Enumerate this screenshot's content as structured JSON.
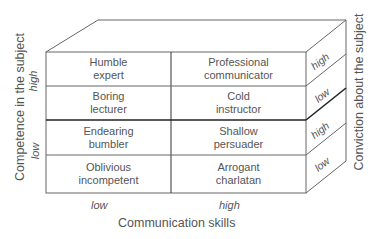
{
  "diagram": {
    "type": "3d-box-matrix",
    "cells": [
      {
        "row": 0,
        "col": 0,
        "label": "Humble\nexpert"
      },
      {
        "row": 0,
        "col": 1,
        "label": "Professional\ncommunicator"
      },
      {
        "row": 1,
        "col": 0,
        "label": "Boring\nlecturer"
      },
      {
        "row": 1,
        "col": 1,
        "label": "Cold\ninstructor"
      },
      {
        "row": 2,
        "col": 0,
        "label": "Endearing\nbumbler"
      },
      {
        "row": 2,
        "col": 1,
        "label": "Shallow\npersuader"
      },
      {
        "row": 3,
        "col": 0,
        "label": "Oblivious\nincompetent"
      },
      {
        "row": 3,
        "col": 1,
        "label": "Arrogant\ncharlatan"
      }
    ],
    "x_axis": {
      "title": "Communication skills",
      "ticks": [
        "low",
        "high"
      ]
    },
    "y_axis": {
      "title": "Competence in the subject",
      "ticks": [
        "high",
        "low"
      ]
    },
    "z_axis": {
      "title": "Conviction about the subject",
      "ticks": [
        "high",
        "low",
        "high",
        "low"
      ]
    },
    "colors": {
      "line": "#555555",
      "bold_line": "#222222",
      "text": "#555555",
      "background": "#ffffff"
    }
  }
}
